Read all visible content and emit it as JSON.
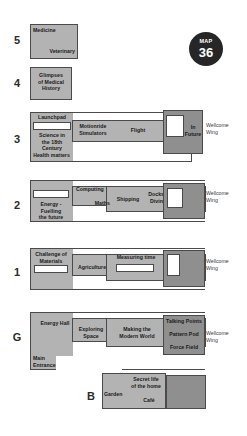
{
  "badge": {
    "word": "MAP",
    "number": "36",
    "bg_color": "#262626",
    "text_color": "#ffffff"
  },
  "colors": {
    "block_fill": "#b3b3b3",
    "block_fill_dark": "#8f8f8f",
    "block_outline": "#4a4a4a",
    "void_fill": "#ffffff",
    "label_text": "#1a1a1a",
    "page_bg": "#ffffff"
  },
  "wing_caption": "Wellcome\nWing",
  "levels": [
    {
      "id": "5",
      "number": "5",
      "galleries": [
        {
          "name": "medicine",
          "label": "Medicine"
        },
        {
          "name": "veterinary",
          "label": "Veterinary"
        }
      ],
      "has_wellcome_wing": false
    },
    {
      "id": "4",
      "number": "4",
      "galleries": [
        {
          "name": "glimpses-of-medical-history",
          "label": "Glimpses\nof Medical\nHistory"
        }
      ],
      "has_wellcome_wing": false
    },
    {
      "id": "3",
      "number": "3",
      "galleries": [
        {
          "name": "launchpad",
          "label": "Launchpad"
        },
        {
          "name": "science-in-the-18th-century",
          "label": "Science in\nthe 18th\nCentury"
        },
        {
          "name": "health-matters",
          "label": "Health matters"
        },
        {
          "name": "motionride-simulators",
          "label": "Motionride\nSimulators"
        },
        {
          "name": "flight",
          "label": "Flight"
        },
        {
          "name": "in-future",
          "label": "In\nFuture"
        }
      ],
      "has_wellcome_wing": true
    },
    {
      "id": "2",
      "number": "2",
      "galleries": [
        {
          "name": "energy-fuelling-the-future",
          "label": "Energy -\nFuelling\nthe future"
        },
        {
          "name": "computing",
          "label": "Computing"
        },
        {
          "name": "maths",
          "label": "Maths"
        },
        {
          "name": "shipping",
          "label": "Shipping"
        },
        {
          "name": "docks-and-diving",
          "label": "Docks&\nDiving"
        }
      ],
      "has_wellcome_wing": true
    },
    {
      "id": "1",
      "number": "1",
      "galleries": [
        {
          "name": "challenge-of-materials",
          "label": "Challenge of\nMaterials"
        },
        {
          "name": "agriculture",
          "label": "Agriculture"
        },
        {
          "name": "measuring-time",
          "label": "Measuring time"
        }
      ],
      "has_wellcome_wing": true
    },
    {
      "id": "G",
      "number": "G",
      "galleries": [
        {
          "name": "energy-hall",
          "label": "Energy Hall"
        },
        {
          "name": "exploring-space",
          "label": "Exploring\nSpace"
        },
        {
          "name": "making-the-modern-world",
          "label": "Making the\nModern World"
        },
        {
          "name": "talking-points",
          "label": "Talking Points"
        },
        {
          "name": "pattern-pod",
          "label": "Pattern Pod"
        },
        {
          "name": "force-field",
          "label": "Force Field"
        },
        {
          "name": "main-entrance",
          "label": "Main\nEntrance"
        }
      ],
      "has_wellcome_wing": true
    },
    {
      "id": "B",
      "number": "B",
      "galleries": [
        {
          "name": "secret-life-of-the-home",
          "label": "Secret life\nof the home"
        },
        {
          "name": "garden",
          "label": "Garden"
        },
        {
          "name": "cafe",
          "label": "Café"
        }
      ],
      "has_wellcome_wing": false
    }
  ]
}
